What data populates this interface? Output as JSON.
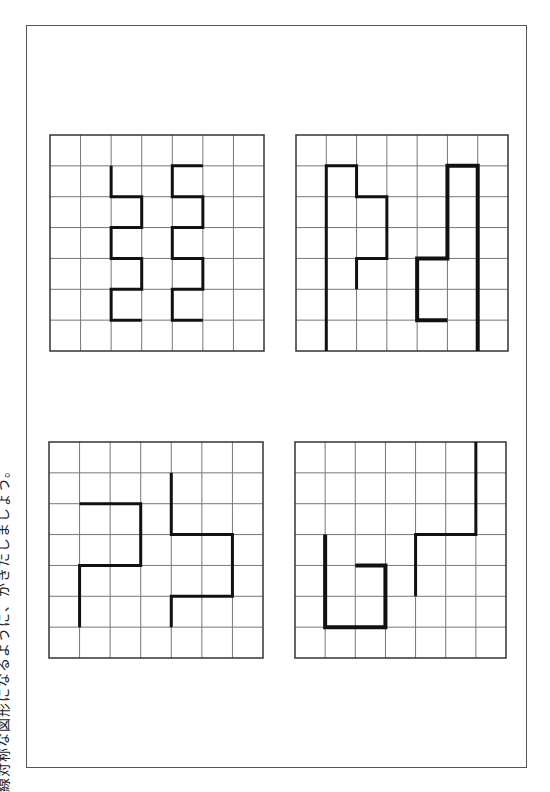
{
  "instruction": "線対称な図形になるように、かきたしましょう。",
  "grid_size": {
    "cols": 7,
    "rows": 7
  },
  "colors": {
    "grid_line": "#777777",
    "border": "#333333",
    "shape": "#111111"
  },
  "puzzles": [
    {
      "id": "top-left",
      "paths": [
        {
          "weight": "normal",
          "points": [
            [
              2,
              1
            ],
            [
              2,
              2
            ],
            [
              3,
              2
            ],
            [
              3,
              3
            ],
            [
              2,
              3
            ],
            [
              2,
              4
            ],
            [
              3,
              4
            ],
            [
              3,
              5
            ],
            [
              2,
              5
            ],
            [
              2,
              6
            ],
            [
              3,
              6
            ]
          ]
        },
        {
          "weight": "normal",
          "points": [
            [
              5,
              1
            ],
            [
              4,
              1
            ],
            [
              4,
              2
            ],
            [
              5,
              2
            ],
            [
              5,
              3
            ],
            [
              4,
              3
            ],
            [
              4,
              4
            ],
            [
              5,
              4
            ],
            [
              5,
              5
            ],
            [
              4,
              5
            ],
            [
              4,
              6
            ],
            [
              5,
              6
            ]
          ]
        }
      ]
    },
    {
      "id": "top-right",
      "paths": [
        {
          "weight": "normal",
          "points": [
            [
              1,
              7
            ],
            [
              1,
              1
            ],
            [
              2,
              1
            ],
            [
              2,
              2
            ],
            [
              3,
              2
            ],
            [
              3,
              4
            ],
            [
              2,
              4
            ],
            [
              2,
              5
            ]
          ]
        },
        {
          "weight": "bold",
          "points": [
            [
              6,
              7
            ],
            [
              6,
              1
            ],
            [
              5,
              1
            ],
            [
              5,
              4
            ],
            [
              4,
              4
            ],
            [
              4,
              6
            ],
            [
              5,
              6
            ]
          ]
        }
      ]
    },
    {
      "id": "bottom-left",
      "paths": [
        {
          "weight": "normal",
          "points": [
            [
              1,
              2
            ],
            [
              3,
              2
            ],
            [
              3,
              4
            ],
            [
              1,
              4
            ],
            [
              1,
              6
            ]
          ]
        },
        {
          "weight": "normal",
          "points": [
            [
              4,
              1
            ],
            [
              4,
              3
            ],
            [
              6,
              3
            ],
            [
              6,
              5
            ],
            [
              4,
              5
            ],
            [
              4,
              6
            ]
          ]
        }
      ]
    },
    {
      "id": "bottom-right",
      "paths": [
        {
          "weight": "bold",
          "points": [
            [
              1,
              3
            ],
            [
              1,
              6
            ],
            [
              3,
              6
            ],
            [
              3,
              4
            ],
            [
              2,
              4
            ]
          ]
        },
        {
          "weight": "normal",
          "points": [
            [
              6,
              0
            ],
            [
              6,
              3
            ],
            [
              4,
              3
            ],
            [
              4,
              5
            ]
          ]
        }
      ]
    }
  ]
}
